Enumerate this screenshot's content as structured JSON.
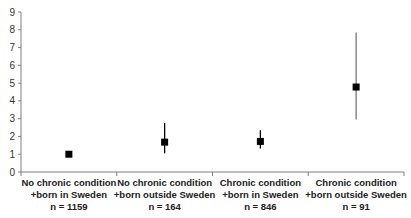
{
  "chart_data": {
    "type": "scatter",
    "subtype": "point-with-error-bars",
    "title": "",
    "xlabel": "",
    "ylabel": "",
    "ylim": [
      0,
      9
    ],
    "yticks": [
      0,
      1,
      2,
      3,
      4,
      5,
      6,
      7,
      8,
      9
    ],
    "grid": false,
    "legend": null,
    "categories": [
      {
        "line1": "No chronic condition",
        "line2": "+born in Sweden",
        "line3": "n = 1159"
      },
      {
        "line1": "No chronic condition",
        "line2": "+born outside Sweden",
        "line3": "n = 164"
      },
      {
        "line1": "Chronic condition",
        "line2": "+born in Sweden",
        "line3": "n = 846"
      },
      {
        "line1": "Chronic condition",
        "line2": "+born outside Sweden",
        "line3": "n = 91"
      }
    ],
    "series": [
      {
        "name": "Estimate",
        "values": [
          1.0,
          1.68,
          1.72,
          4.78
        ],
        "lower": [
          1.0,
          1.05,
          1.32,
          2.95
        ],
        "upper": [
          1.0,
          2.75,
          2.35,
          7.85
        ]
      }
    ],
    "marker_color": "#000000",
    "errorbar_colors": [
      "#000000",
      "#000000",
      "#000000",
      "#777777"
    ]
  }
}
